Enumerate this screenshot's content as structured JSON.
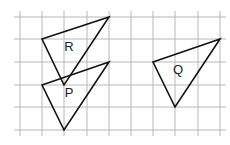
{
  "grid": {
    "x_lines": [
      20,
      42,
      64,
      87,
      109,
      131,
      153,
      175,
      198,
      220
    ],
    "y_lines": [
      17,
      39,
      62,
      85,
      107,
      130
    ],
    "x_extent": [
      14,
      226
    ],
    "y_extent": [
      11,
      136
    ],
    "color": "#b8b8b8"
  },
  "shapes": [
    {
      "name": "R",
      "label": "R",
      "points": [
        [
          42,
          39
        ],
        [
          109,
          17
        ],
        [
          64,
          85
        ]
      ],
      "label_pos": [
        69,
        48
      ]
    },
    {
      "name": "P",
      "label": "P",
      "points": [
        [
          42,
          85
        ],
        [
          109,
          62
        ],
        [
          64,
          130
        ]
      ],
      "label_pos": [
        69,
        94
      ]
    },
    {
      "name": "Q",
      "label": "Q",
      "points": [
        [
          153,
          62
        ],
        [
          220,
          39
        ],
        [
          175,
          107
        ]
      ],
      "label_pos": [
        178,
        71
      ]
    }
  ],
  "stroke_color": "#111111"
}
